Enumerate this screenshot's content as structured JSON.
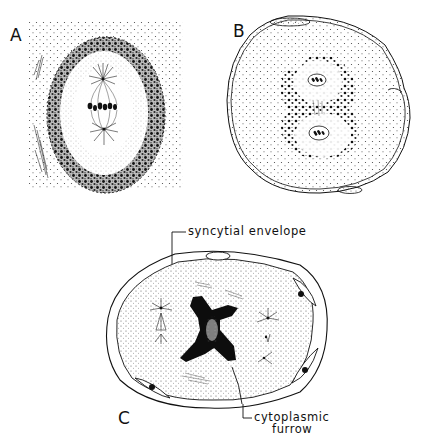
{
  "figure": {
    "panels": [
      {
        "label": "A",
        "description": "Nucleus in mitotic metaphase with spindle poles and condensed chromosomes, surrounded by granular perinuclear ring"
      },
      {
        "label": "B",
        "description": "Cell with two daughter nuclei after division, surrounded by dense granules, within envelope with flattened nuclei"
      },
      {
        "label": "C",
        "description": "Syncytial cell with two spindles and X-shaped dark mass, cytoplasmic furrow forming"
      }
    ],
    "annotations": {
      "syncytial_envelope": "syncytial envelope",
      "cytoplasmic_furrow_line1": "cytoplasmic",
      "cytoplasmic_furrow_line2": "furrow"
    },
    "colors": {
      "ink": "#111111",
      "background": "#ffffff",
      "stipple": "#555555"
    }
  }
}
